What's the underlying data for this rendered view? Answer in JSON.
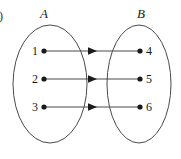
{
  "figure": {
    "tag": ")",
    "caption": "",
    "sets": [
      {
        "name": "set-a",
        "label": "A",
        "cx": 50,
        "cy": 84,
        "rx": 37,
        "ry": 59,
        "label_x": 44,
        "label_y": 18,
        "elements": [
          {
            "label": "1",
            "dot_x": 44,
            "dot_y": 51,
            "text_x": 38,
            "text_y": 55
          },
          {
            "label": "2",
            "dot_x": 44,
            "dot_y": 79,
            "text_x": 38,
            "text_y": 83
          },
          {
            "label": "3",
            "dot_x": 44,
            "dot_y": 107,
            "text_x": 38,
            "text_y": 111
          }
        ]
      },
      {
        "name": "set-b",
        "label": "B",
        "cx": 139,
        "cy": 84,
        "rx": 32,
        "ry": 59,
        "label_x": 141,
        "label_y": 18,
        "elements": [
          {
            "label": "4",
            "dot_x": 140,
            "dot_y": 51,
            "text_x": 146,
            "text_y": 55
          },
          {
            "label": "5",
            "dot_x": 140,
            "dot_y": 79,
            "text_x": 146,
            "text_y": 83
          },
          {
            "label": "6",
            "dot_x": 140,
            "dot_y": 107,
            "text_x": 146,
            "text_y": 111
          }
        ]
      }
    ],
    "arrows": [
      {
        "from": "1",
        "to": "4",
        "x1": 45,
        "y1": 51,
        "x2": 139,
        "y2": 51,
        "head_x": 93,
        "head_y": 51
      },
      {
        "from": "2",
        "to": "5",
        "x1": 45,
        "y1": 79,
        "x2": 139,
        "y2": 79,
        "head_x": 93,
        "head_y": 79
      },
      {
        "from": "3",
        "to": "6",
        "x1": 45,
        "y1": 107,
        "x2": 139,
        "y2": 107,
        "head_x": 93,
        "head_y": 107
      }
    ],
    "colors": {
      "oval_stroke": "#4a4a4a",
      "arrow_stroke": "#4a4a4a",
      "dot_fill": "#1a1a1a",
      "text": "#1a1a1a",
      "background": "#ffffff"
    }
  }
}
